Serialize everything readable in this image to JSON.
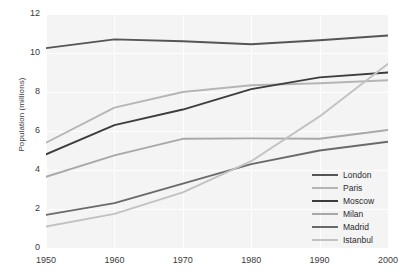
{
  "chart_data": {
    "type": "line",
    "title": "",
    "xlabel": "",
    "ylabel": "Population (millions)",
    "x": [
      1950,
      1960,
      1970,
      1980,
      1990,
      2000
    ],
    "xtick_labels": [
      "1950",
      "1960",
      "1970",
      "1980",
      "1990",
      "2000"
    ],
    "ytick_labels": [
      "0",
      "2",
      "4",
      "6",
      "8",
      "10",
      "12"
    ],
    "yticks": [
      0,
      2,
      4,
      6,
      8,
      10,
      12
    ],
    "xlim": [
      1950,
      2000
    ],
    "ylim": [
      0,
      12
    ],
    "grid": true,
    "legend_position": "bottom-right",
    "series": [
      {
        "name": "London",
        "color": "#555555",
        "values": [
          10.25,
          10.7,
          10.6,
          10.45,
          10.65,
          10.9
        ]
      },
      {
        "name": "Paris",
        "color": "#b5b5b5",
        "values": [
          5.4,
          7.2,
          8.0,
          8.35,
          8.45,
          8.6
        ]
      },
      {
        "name": "Moscow",
        "color": "#3d3d3d",
        "values": [
          4.8,
          6.3,
          7.1,
          8.15,
          8.75,
          9.0
        ]
      },
      {
        "name": "Milan",
        "color": "#a8a8a8",
        "values": [
          3.65,
          4.75,
          5.6,
          5.62,
          5.6,
          6.05
        ]
      },
      {
        "name": "Madrid",
        "color": "#6a6a6a",
        "values": [
          1.7,
          2.3,
          3.3,
          4.3,
          5.0,
          5.45
        ]
      },
      {
        "name": "Istanbul",
        "color": "#c2c2c2",
        "values": [
          1.1,
          1.75,
          2.85,
          4.45,
          6.75,
          9.45
        ]
      }
    ]
  },
  "legend": {
    "items": [
      {
        "label": "London"
      },
      {
        "label": "Paris"
      },
      {
        "label": "Moscow"
      },
      {
        "label": "Milan"
      },
      {
        "label": "Madrid"
      },
      {
        "label": "Istanbul"
      }
    ]
  }
}
